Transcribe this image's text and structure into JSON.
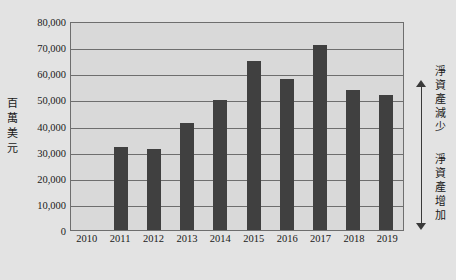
{
  "chart_data": {
    "type": "bar",
    "title": "",
    "xlabel": "",
    "ylabel": "百萬美元",
    "categories": [
      "2010",
      "2011",
      "2012",
      "2013",
      "2014",
      "2015",
      "2016",
      "2017",
      "2018",
      "2019"
    ],
    "values": [
      0,
      31700,
      31200,
      40800,
      49900,
      64600,
      57800,
      71000,
      53500,
      51700
    ],
    "ylim": [
      0,
      80000
    ],
    "yticks": [
      0,
      10000,
      20000,
      30000,
      40000,
      50000,
      60000,
      70000,
      80000
    ],
    "ytick_labels": [
      "0",
      "10,000",
      "20,000",
      "30,000",
      "40,000",
      "50,000",
      "60,000",
      "70,000",
      "80,000"
    ],
    "grid": true,
    "legend": "none",
    "series": [
      {
        "name": "淨資產",
        "values": [
          0,
          31700,
          31200,
          40800,
          49900,
          64600,
          57800,
          71000,
          53500,
          51700
        ]
      }
    ],
    "annotations": [
      {
        "name": "net-assets-decrease",
        "text": "淨資產減少",
        "direction": "up"
      },
      {
        "name": "net-assets-increase",
        "text": "淨資產增加",
        "direction": "down"
      }
    ],
    "colors": {
      "bar": "#404040",
      "plot_background": "#d9d9d9",
      "page_background": "#e3e3e3",
      "gridline": "#6e6e6e",
      "text": "#1a1a1a"
    }
  }
}
